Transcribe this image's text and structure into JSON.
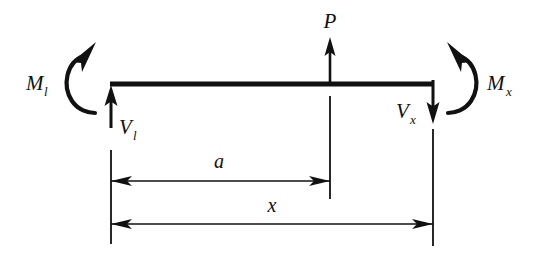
{
  "figure": {
    "type": "free-body-diagram",
    "background_color": "#ffffff",
    "ink_color": "#111111"
  },
  "beam": {
    "name": "beam-member",
    "left_x": 110,
    "right_x": 433,
    "y": 84
  },
  "loads": {
    "applied_force": {
      "symbol": "P",
      "direction": "up",
      "at_x": 330
    },
    "left_shear": {
      "symbol": "V",
      "subscript": "l",
      "direction": "up",
      "at_x": 111
    },
    "right_shear": {
      "symbol": "V",
      "subscript": "x",
      "direction": "down",
      "at_x": 433
    },
    "left_moment": {
      "symbol": "M",
      "subscript": "l",
      "sense": "counterclockwise"
    },
    "right_moment": {
      "symbol": "M",
      "subscript": "x",
      "sense": "clockwise"
    }
  },
  "dimensions": [
    {
      "name": "dimension-a",
      "label": "a",
      "from_x": 111,
      "to_x": 330,
      "y": 181,
      "arrows": "double"
    },
    {
      "name": "dimension-x",
      "label": "x",
      "from_x": 111,
      "to_x": 433,
      "y": 224,
      "arrows": "double"
    }
  ]
}
